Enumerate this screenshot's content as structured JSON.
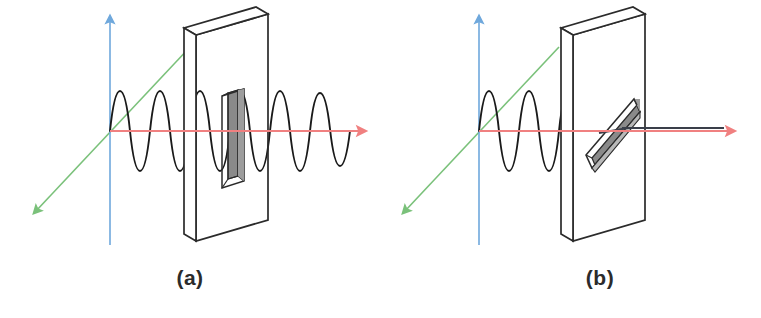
{
  "figure": {
    "background_color": "#ffffff",
    "width": 761,
    "height": 318
  },
  "colors": {
    "y_axis": "#6fa8dc",
    "x_axis": "#f08080",
    "z_axis": "#7ac17a",
    "wave": "#1a1a1a",
    "plate_outline": "#2b2b2b",
    "slit_fill": "#8a8a8a",
    "slit_fill_light": "#b8b8b8",
    "caption": "#2b2b2b",
    "transmitted_line": "#3a3f4a"
  },
  "panels": [
    {
      "id": "a",
      "caption": "(a)",
      "slit_orientation": "vertical",
      "wave_polarization": "vertical",
      "wave_passes": true,
      "origin": {
        "x": 110,
        "y": 131
      },
      "axes": {
        "y": {
          "name": "vertical-axis",
          "from": [
            110,
            245
          ],
          "to": [
            110,
            17
          ],
          "color": "#6fa8dc",
          "arrow": "up"
        },
        "x": {
          "name": "propagation-axis",
          "from": [
            110,
            131
          ],
          "to": [
            366,
            131
          ],
          "color": "#f08080",
          "arrow": "right"
        },
        "z": {
          "name": "depth-axis",
          "from": [
            190,
            47
          ],
          "to": [
            35,
            212
          ],
          "color": "#7ac17a",
          "arrow": "down-left"
        }
      },
      "wave": {
        "amplitude": 40,
        "wavelength": 40,
        "x_start": 110,
        "x_end": 352,
        "cycles": 6,
        "orientation": "vertical"
      },
      "plate": {
        "front_top_left": [
          196,
          35
        ],
        "front_top_right": [
          268,
          14
        ],
        "front_bottom_left": [
          196,
          241
        ],
        "thickness": 13
      },
      "slit": {
        "x": 232,
        "y_top": 88,
        "width": 10,
        "height": 92,
        "orientation": "vertical"
      }
    },
    {
      "id": "b",
      "caption": "(b)",
      "slit_orientation": "horizontal",
      "wave_polarization": "vertical",
      "wave_passes": false,
      "origin": {
        "x": 479,
        "y": 131
      },
      "axes": {
        "y": {
          "name": "vertical-axis",
          "from": [
            479,
            245
          ],
          "to": [
            479,
            17
          ],
          "color": "#6fa8dc",
          "arrow": "up"
        },
        "x": {
          "name": "propagation-axis",
          "from": [
            479,
            131
          ],
          "to": [
            735,
            131
          ],
          "color": "#f08080",
          "arrow": "right"
        },
        "z": {
          "name": "depth-axis",
          "from": [
            559,
            47
          ],
          "to": [
            404,
            212
          ],
          "color": "#7ac17a",
          "arrow": "down-left"
        }
      },
      "wave": {
        "amplitude": 40,
        "wavelength": 40,
        "x_start": 479,
        "x_end": 570,
        "cycles": 2.25,
        "orientation": "vertical"
      },
      "plate": {
        "front_top_left": [
          573,
          35
        ],
        "front_top_right": [
          645,
          14
        ],
        "front_bottom_left": [
          573,
          241
        ],
        "thickness": 13
      },
      "slit": {
        "orientation": "horizontal",
        "length": 75,
        "thickness": 11
      },
      "transmitted": {
        "from": [
          627,
          128
        ],
        "to": [
          724,
          128
        ],
        "color": "#3a3f4a",
        "description": "blocked beam shown as plain line"
      }
    }
  ]
}
